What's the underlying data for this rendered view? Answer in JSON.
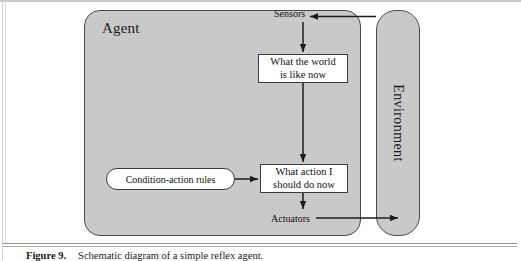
{
  "figure": {
    "agent": {
      "label": "Agent"
    },
    "environment": {
      "label": "Environment"
    },
    "nodes": [
      {
        "id": "world",
        "label": "What the world\nis like now"
      },
      {
        "id": "action",
        "label": "What action I\nshould do now"
      },
      {
        "id": "rules",
        "label": "Condition-action rules"
      }
    ],
    "ports": {
      "sensors": "Sensors",
      "actuators": "Actuators"
    },
    "node_world_line1": "What the world",
    "node_world_line2": "is like now",
    "node_action_line1": "What action I",
    "node_action_line2": "should do now",
    "node_rules_label": "Condition-action rules",
    "colors": {
      "agent_fill": "#c9c9c9",
      "environment_fill": "#c9c9c9",
      "box_fill": "#ffffff",
      "outline": "#4a4a4a",
      "arrow": "#1c1c1c",
      "page_background": "#ffffff"
    }
  },
  "caption": {
    "label": "Figure 9.",
    "text": "Schematic diagram of a simple reflex agent."
  }
}
